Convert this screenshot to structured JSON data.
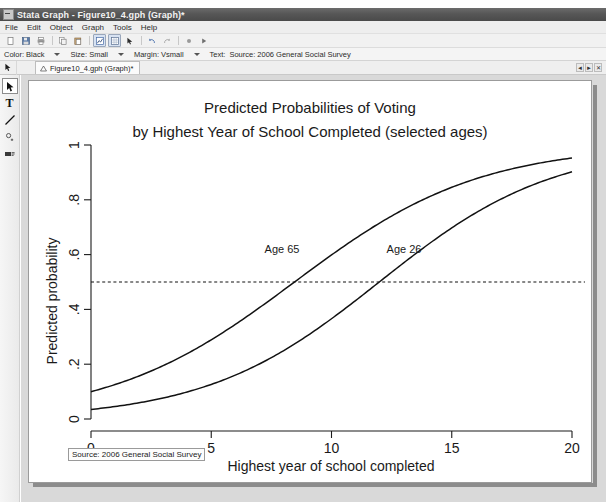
{
  "window": {
    "title": "Stata Graph - Figure10_4.gph (Graph)*",
    "icon": "stata-graph-icon"
  },
  "menubar": {
    "items": [
      {
        "label": "File"
      },
      {
        "label": "Edit"
      },
      {
        "label": "Object"
      },
      {
        "label": "Graph"
      },
      {
        "label": "Tools"
      },
      {
        "label": "Help"
      }
    ]
  },
  "toolbar": {
    "buttons": [
      {
        "name": "new-icon"
      },
      {
        "name": "save-icon"
      },
      {
        "name": "print-icon"
      },
      {
        "name": "copy-icon"
      },
      {
        "name": "paste-icon"
      },
      {
        "name": "graph-editor-icon"
      },
      {
        "name": "grid-icon"
      },
      {
        "name": "pointer-tool-icon"
      },
      {
        "name": "undo-icon"
      },
      {
        "name": "redo-icon"
      },
      {
        "name": "record-icon"
      },
      {
        "name": "play-icon"
      }
    ]
  },
  "propertiesbar": {
    "color": {
      "label": "Color: Black"
    },
    "size": {
      "label": "Size: Small"
    },
    "margin": {
      "label": "Margin: Vsmall"
    },
    "text": {
      "label": "Text:"
    },
    "text_value": "Source: 2006 General Social Survey"
  },
  "tabstrip": {
    "tab_label": "Figure10_4.gph (Graph)*",
    "nav_prev": "◄",
    "nav_next": "►",
    "close": "✕"
  },
  "tool_palette": {
    "items": [
      {
        "name": "pointer-tool",
        "glyph": "➤",
        "selected": true
      },
      {
        "name": "text-tool",
        "glyph": "T",
        "selected": false
      },
      {
        "name": "line-tool",
        "glyph": "line",
        "selected": false
      },
      {
        "name": "marker-tool",
        "glyph": "marker",
        "selected": false
      },
      {
        "name": "label-tool",
        "glyph": "label",
        "selected": false
      }
    ]
  },
  "source_note": "Source: 2006 General Social Survey",
  "chart_data": {
    "type": "line",
    "title": "Predicted Probabilities of Voting",
    "subtitle": "by Highest Year of School Completed (selected ages)",
    "xlabel": "Highest year of school completed",
    "ylabel": "Predicted probability",
    "xlim": [
      0,
      20
    ],
    "ylim": [
      0,
      1
    ],
    "xticks": [
      0,
      5,
      10,
      15,
      20
    ],
    "xticklabels": [
      "0",
      "5",
      "10",
      "15",
      "20"
    ],
    "yticks": [
      0,
      0.2,
      0.4,
      0.6,
      0.8,
      1
    ],
    "yticklabels": [
      "0",
      ".2",
      ".4",
      ".6",
      ".8",
      "1"
    ],
    "grid": false,
    "legend": "none",
    "reference_lines": [
      {
        "axis": "y",
        "value": 0.5,
        "style": "dashed"
      }
    ],
    "annotations": [
      {
        "text": "Age 65",
        "x": 6.4,
        "y": 0.625
      },
      {
        "text": "Age 26",
        "x": 11.1,
        "y": 0.625
      }
    ],
    "x": [
      0,
      1,
      2,
      3,
      4,
      5,
      6,
      7,
      8,
      9,
      10,
      11,
      12,
      13,
      14,
      15,
      16,
      17,
      18,
      19,
      20
    ],
    "series": [
      {
        "name": "Age 65",
        "values": [
          0.1,
          0.118,
          0.139,
          0.163,
          0.191,
          0.223,
          0.26,
          0.301,
          0.347,
          0.397,
          0.45,
          0.505,
          0.56,
          0.613,
          0.664,
          0.711,
          0.754,
          0.792,
          0.826,
          0.855,
          0.88
        ]
      },
      {
        "name": "Age 26",
        "values": [
          0.035,
          0.042,
          0.051,
          0.061,
          0.073,
          0.088,
          0.105,
          0.125,
          0.149,
          0.177,
          0.209,
          0.245,
          0.286,
          0.331,
          0.379,
          0.431,
          0.483,
          0.536,
          0.587,
          0.636,
          0.681
        ]
      }
    ],
    "curve_fits": [
      {
        "name": "Age 65",
        "model": "logistic",
        "intercept": -2.2,
        "slope": 0.26,
        "p_at_x0": 0.1,
        "p_at_x20": 0.98,
        "x_at_p50": 8.5
      },
      {
        "name": "Age 26",
        "model": "logistic",
        "intercept": -3.32,
        "slope": 0.277,
        "p_at_x0": 0.035,
        "p_at_x20": 0.92,
        "x_at_p50": 12.0
      }
    ]
  }
}
